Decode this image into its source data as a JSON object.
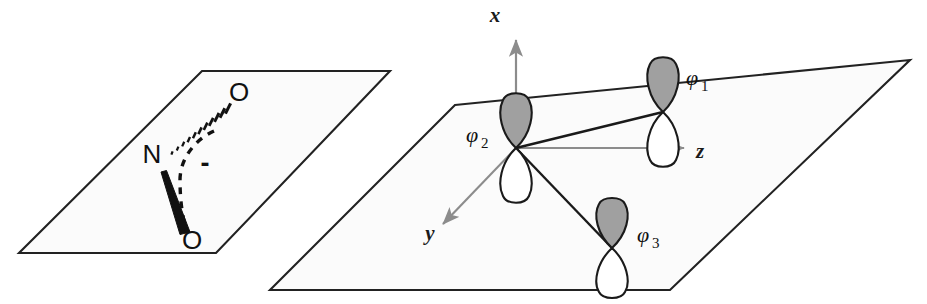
{
  "figure": {
    "background_color": "#ffffff",
    "plane_fill": "#fbfbfb",
    "plane_stroke": "#222222",
    "lobe_shaded_fill": "#a0a0a0",
    "lobe_empty_fill": "#ffffff",
    "lobe_stroke": "#1a1a1a",
    "axis_color": "#8c8c8c",
    "bond_color": "#1a1a1a"
  },
  "left_panel": {
    "name": "nitrite-structure-panel",
    "plane": {
      "name": "molecular-plane-left",
      "points": "202,71 390,71 216,253 19,253"
    },
    "atoms": [
      {
        "id": "n-center",
        "label": "N",
        "x": 152,
        "y": 163
      },
      {
        "id": "o-upper",
        "label": "O",
        "x": 239,
        "y": 101
      },
      {
        "id": "o-lower",
        "label": "O",
        "x": 192,
        "y": 249
      }
    ],
    "charge": {
      "id": "negative-charge",
      "label": "-",
      "x": 205,
      "y": 172
    },
    "bonds": [
      {
        "id": "hashed-wedge-bond-n-o-upper",
        "type": "hashed-wedge"
      },
      {
        "id": "solid-wedge-bond-n-o-lower",
        "type": "solid-wedge"
      }
    ],
    "arc": {
      "id": "delocalization-arc",
      "type": "dashed-arc"
    }
  },
  "right_panel": {
    "name": "orbital-basis-panel",
    "plane": {
      "name": "molecular-plane-right",
      "points": "455,105 910,60 670,290 270,290"
    },
    "axes": [
      {
        "id": "axis-x",
        "label": "x",
        "label_x": 495,
        "label_y": 22,
        "direction": "up"
      },
      {
        "id": "axis-y",
        "label": "y",
        "label_x": 430,
        "label_y": 240,
        "direction": "down-left"
      },
      {
        "id": "axis-z",
        "label": "z",
        "label_x": 700,
        "label_y": 158,
        "direction": "right"
      }
    ],
    "origin": {
      "x": 516,
      "y": 148
    },
    "orbitals": [
      {
        "id": "orbital-phi-2",
        "symbol": "φ",
        "subscript": "2",
        "center_x": 516,
        "center_y": 148,
        "label_x": 466,
        "label_y": 142
      },
      {
        "id": "orbital-phi-1",
        "symbol": "φ",
        "subscript": "1",
        "center_x": 663,
        "center_y": 112,
        "label_x": 686,
        "label_y": 85
      },
      {
        "id": "orbital-phi-3",
        "symbol": "φ",
        "subscript": "3",
        "center_x": 612,
        "center_y": 248,
        "label_x": 637,
        "label_y": 242
      }
    ],
    "bonds": [
      {
        "id": "bond-phi2-phi1",
        "from": "orbital-phi-2",
        "to": "orbital-phi-1"
      },
      {
        "id": "bond-phi2-phi3",
        "from": "orbital-phi-2",
        "to": "orbital-phi-3"
      }
    ]
  }
}
